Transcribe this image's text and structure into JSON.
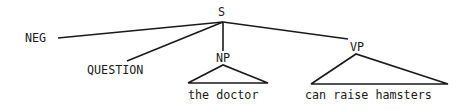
{
  "diagram": {
    "type": "syntax-tree",
    "root": {
      "label": "S",
      "children": [
        {
          "label": "NEG"
        },
        {
          "label": "QUESTION"
        },
        {
          "label": "NP",
          "terminal": "the doctor",
          "collapsed": true
        },
        {
          "label": "VP",
          "terminal": "can raise hamsters",
          "collapsed": true
        }
      ]
    },
    "labels": {
      "s": "S",
      "neg": "NEG",
      "question": "QUESTION",
      "np": "NP",
      "vp": "VP",
      "np_text": "the doctor",
      "vp_text": "can raise hamsters"
    },
    "colors": {
      "ink": "#1a1a1a",
      "background": "#ffffff"
    }
  }
}
